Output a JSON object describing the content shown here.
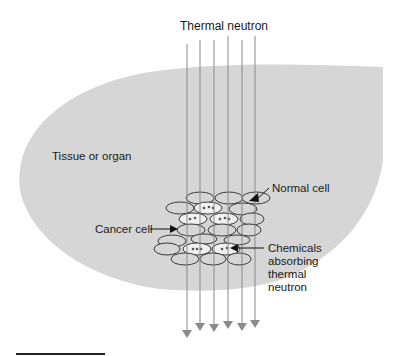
{
  "diagram": {
    "type": "schematic",
    "colors": {
      "tissue_fill": "#d6d6d6",
      "cell_outline": "#3a3a3a",
      "cancer_cell_fill": "#f2f2f2",
      "beam_line": "#8a8a8a",
      "arrow": "#111111",
      "text": "#1a1a1a"
    }
  },
  "labels": {
    "beam_title": "Thermal neutron",
    "tissue": "Tissue or organ",
    "normal_cell": "Normal cell",
    "cancer_cell": "Cancer cell",
    "chemicals": [
      "Chemicals",
      "absorbing",
      "thermal",
      "neutron"
    ]
  },
  "beams": {
    "count": 6,
    "x": [
      187,
      200,
      214,
      228,
      242,
      255
    ],
    "y_start": [
      44,
      40,
      40,
      36,
      40,
      36
    ],
    "y_end": [
      334,
      327,
      328,
      325,
      327,
      324
    ]
  },
  "cells": {
    "normal": [
      {
        "x": 200,
        "y": 198
      },
      {
        "x": 229,
        "y": 198
      },
      {
        "x": 250,
        "y": 198
      },
      {
        "x": 174,
        "y": 208
      },
      {
        "x": 236,
        "y": 209
      },
      {
        "x": 190,
        "y": 230
      },
      {
        "x": 236,
        "y": 230
      },
      {
        "x": 182,
        "y": 241
      },
      {
        "x": 214,
        "y": 241
      },
      {
        "x": 167,
        "y": 248
      },
      {
        "x": 187,
        "y": 258
      },
      {
        "x": 214,
        "y": 258
      },
      {
        "x": 236,
        "y": 258
      }
    ],
    "cancer": [
      {
        "x": 207,
        "y": 208
      },
      {
        "x": 189,
        "y": 219
      },
      {
        "x": 222,
        "y": 219
      },
      {
        "x": 199,
        "y": 248
      },
      {
        "x": 227,
        "y": 248
      }
    ]
  },
  "scale_bar": {
    "x1": 16,
    "x2": 105,
    "y": 354
  }
}
